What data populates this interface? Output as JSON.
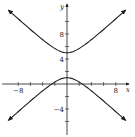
{
  "chart_data": {
    "type": "line",
    "title": "",
    "xlabel": "x",
    "ylabel": "y",
    "xlim": [
      -10,
      10
    ],
    "ylim": [
      -8,
      12
    ],
    "grid": false,
    "legend": null,
    "x_ticks": [
      -8,
      -6,
      -4,
      -2,
      2,
      4,
      6,
      8
    ],
    "y_ticks": [
      -6,
      -4,
      -2,
      2,
      4,
      6,
      8,
      10
    ],
    "x_tick_labels": [
      {
        "value": -8,
        "label": "−8"
      },
      {
        "value": 8,
        "label": "8"
      }
    ],
    "y_tick_labels": [
      {
        "value": 8,
        "label": "8"
      },
      {
        "value": 4,
        "label": "4"
      },
      {
        "value": -4,
        "label": "−4"
      }
    ],
    "series": [
      {
        "name": "hyperbola",
        "equation": "(y-3)^2/4 - x^2/5 = 1",
        "center": [
          0,
          3
        ],
        "a": 2,
        "b2": 5,
        "branches": [
          "upper",
          "lower"
        ],
        "upper_vertex": [
          0,
          5
        ],
        "lower_vertex": [
          0,
          1
        ],
        "x_intercepts": [
          -2.5,
          2.5
        ],
        "x_range": [
          -9.6,
          9.6
        ],
        "arrows": true
      }
    ],
    "annotations": []
  },
  "style": {
    "line_color": "#1a1a1a",
    "axis_color": "#1a1a1a"
  }
}
